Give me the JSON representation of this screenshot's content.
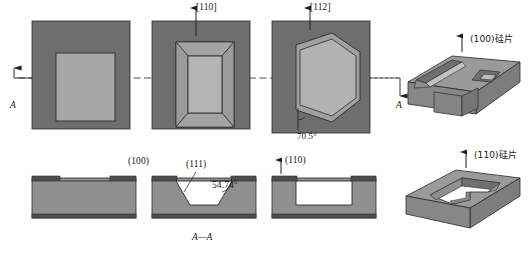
{
  "figure": {
    "section_label": "A—A",
    "section_mark_left": "A",
    "section_mark_right": "A"
  },
  "colors": {
    "mask_dark": "#6e6e6e",
    "wafer_mid": "#8f8f8f",
    "cavity_light": "#a8a8a8",
    "cavity_lighter": "#bdbdbd",
    "face_top": "#9a9a9a",
    "face_front": "#7a7a7a",
    "face_side": "#8a8a8a",
    "outline": "#2b2b2b",
    "page_bg": "#ffffff",
    "centerline": "#3a3a3a"
  },
  "top_views": [
    {
      "name": "mask-opening-rectangle",
      "direction_label": "",
      "caption": "",
      "description": "rectangular mask window, square substrate"
    },
    {
      "name": "truncated-pyramid-cavity",
      "direction_label": "[110]",
      "caption": "",
      "description": "inverted truncated pyramid, four (111) sidewalls"
    },
    {
      "name": "hexagonal-cavity",
      "direction_label": "[112]",
      "caption": "",
      "angle_label": "70.5°",
      "description": "hexagonal groove with vertical (111) sidewalls"
    }
  ],
  "cross_sections": [
    {
      "name": "section-100-flat",
      "plane_label": "(100)",
      "description": "masked (100) wafer before etch"
    },
    {
      "name": "section-111-sloped",
      "plane_label": "(111)",
      "angle_label": "54.74°",
      "description": "V-groove bounded by (111) planes at 54.74 degrees"
    },
    {
      "name": "section-110-vertical",
      "plane_label": "(110)",
      "description": "straight-walled trench in (110) wafer"
    }
  ],
  "isometric_views": [
    {
      "name": "iso-100-wafer",
      "label": "(100)硅片",
      "description": "(100) silicon wafer with pyramidal pit and V-groove"
    },
    {
      "name": "iso-110-wafer",
      "label": "(110)硅片",
      "description": "(110) silicon wafer with steep-walled cavity"
    }
  ]
}
